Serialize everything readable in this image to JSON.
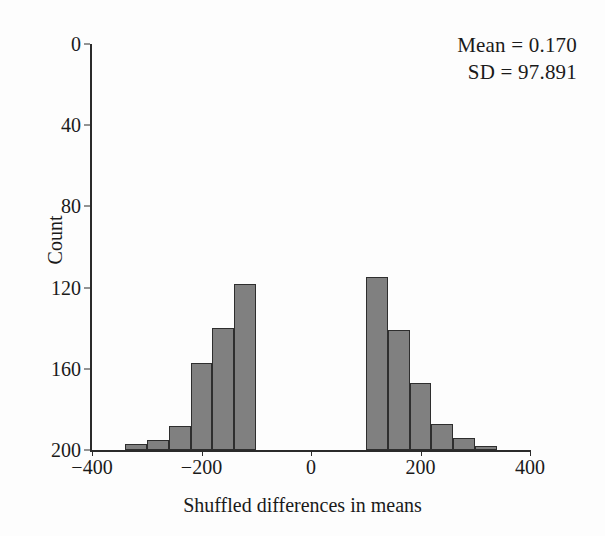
{
  "chart_data": {
    "type": "bar",
    "title": "",
    "subtitle": "",
    "xlabel": "Shuffled differences in means",
    "ylabel": "Count",
    "grid": false,
    "legend": "none",
    "orientation": "vertical-bars-inverted-y-axis",
    "xlim": [
      -400,
      400
    ],
    "xticks": [
      -400,
      -200,
      0,
      200,
      400
    ],
    "xticklabels": [
      "−400",
      "−200",
      "0",
      "200",
      "400"
    ],
    "ylim_top": 0,
    "ylim_bottom": 200,
    "yticks": [
      0,
      40,
      80,
      120,
      160,
      200
    ],
    "yticklabels": [
      "0",
      "40",
      "80",
      "120",
      "160",
      "200"
    ],
    "y_axis_inverted": true,
    "bin_width": 40,
    "bin_left_edges": [
      -340,
      -300,
      -260,
      -220,
      -180,
      -140,
      -100,
      -60,
      -20,
      20,
      60,
      100,
      140,
      180,
      220,
      260,
      300
    ],
    "bin_centers": [
      -320,
      -280,
      -240,
      -200,
      -160,
      -120,
      -80,
      -40,
      0,
      40,
      80,
      120,
      160,
      200,
      240,
      280,
      320
    ],
    "values": [
      3,
      5,
      12,
      43,
      60,
      82,
      114,
      117,
      168,
      155,
      116,
      85,
      59,
      33,
      13,
      6,
      2
    ],
    "bar_fill_color": "#808080",
    "bar_edge_color": "#2e2e2e",
    "axis_color": "#2b2b2b",
    "background_color": "#fdfdfd"
  },
  "annotations": {
    "mean_line": "Mean = 0.170",
    "sd_line": "SD = 97.891"
  }
}
